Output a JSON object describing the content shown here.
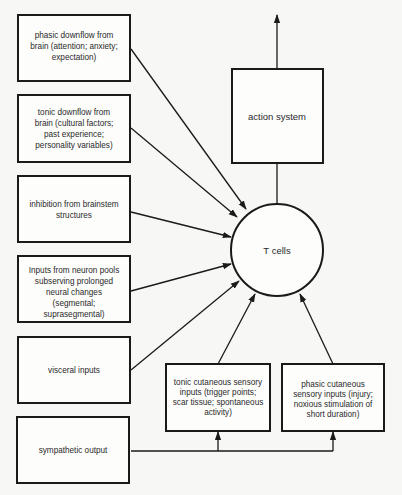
{
  "diagram": {
    "left_boxes": [
      {
        "id": "phasic-downflow",
        "lines": [
          "phasic downflow from",
          "brain (attention; anxiety;",
          "expectation)"
        ]
      },
      {
        "id": "tonic-downflow",
        "lines": [
          "tonic downflow from",
          "brain (cultural factors;",
          "past experience;",
          "personality variables)"
        ]
      },
      {
        "id": "brainstem-inhibition",
        "lines": [
          "inhibition from brainstem",
          "structures"
        ]
      },
      {
        "id": "neuron-pools",
        "lines": [
          "Inputs from neuron pools",
          "subserving prolonged",
          "neural changes",
          "(segmental;",
          "suprasegmental)"
        ]
      },
      {
        "id": "visceral-inputs",
        "lines": [
          "visceral inputs"
        ]
      },
      {
        "id": "sympathetic-output",
        "lines": [
          "sympathetic output"
        ]
      }
    ],
    "bottom_boxes": [
      {
        "id": "tonic-cutaneous",
        "lines": [
          "tonic cutaneous sensory",
          "inputs (trigger points;",
          "scar tissue; spontaneous",
          "activity)"
        ]
      },
      {
        "id": "phasic-cutaneous",
        "lines": [
          "phasic cutaneous",
          "sensory inputs (injury;",
          "noxious stimulation of",
          "short duration)"
        ]
      }
    ],
    "action_box": {
      "label": "action system"
    },
    "center_node": {
      "label": "T cells"
    },
    "colors": {
      "stroke": "#1a1a1a",
      "background": "#f7f7f5",
      "text": "#2a2a2a"
    }
  }
}
